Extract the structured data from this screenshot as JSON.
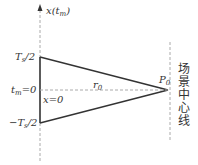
{
  "diagram": {
    "axis_label": {
      "main": "x(t",
      "sub": "m",
      "close": ")"
    },
    "ticks": {
      "top": {
        "main": "T",
        "sub": "s",
        "rest": "/2"
      },
      "zero": {
        "main": "t",
        "sub": "m",
        "rest": "=0"
      },
      "bottom": {
        "main": "−T",
        "sub": "s",
        "rest": "/2"
      }
    },
    "x_zero_label": "x=0",
    "r_label": {
      "main": "r",
      "sub": "0"
    },
    "p_label": {
      "main": "P",
      "sub": "0"
    },
    "scene_center_label": "场景中心线",
    "colors": {
      "line": "#333333",
      "dashed": "#aaaaaa",
      "text": "#333333"
    }
  }
}
